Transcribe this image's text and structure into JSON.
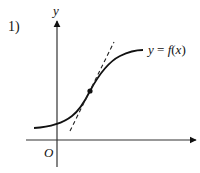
{
  "figure": {
    "problem_number": "1)",
    "y_axis_label": "y",
    "origin_label": "O",
    "curve_label": "y = f(x)",
    "curve_label_parts": {
      "lhs": "y",
      "eq": " = ",
      "fn": "f",
      "open": "(",
      "arg": "x",
      "close": ")"
    },
    "colors": {
      "axis": "#222222",
      "curve": "#111111",
      "tangent": "#222222",
      "background": "#ffffff"
    },
    "elements": {
      "curve": "S-shaped increasing curve (sigmoid-like)",
      "tangent": "dashed tangent line at inflection point",
      "point": "marked point of tangency"
    }
  }
}
